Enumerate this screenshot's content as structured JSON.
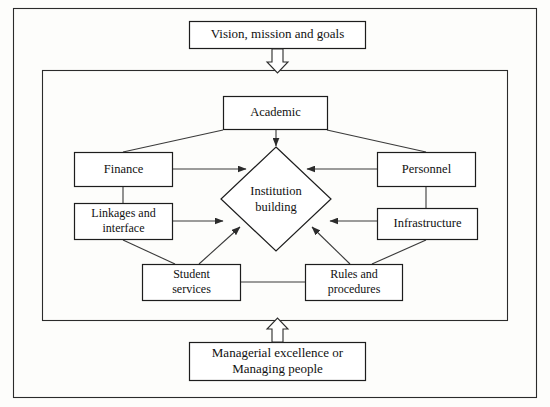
{
  "diagram": {
    "title_top": "Vision, mission and goals",
    "title_bottom_line1": "Managerial excellence or",
    "title_bottom_line2": "Managing people",
    "center": {
      "line1": "Institution",
      "line2": "building"
    },
    "nodes": {
      "academic": "Academic",
      "finance": "Finance",
      "linkages_line1": "Linkages and",
      "linkages_line2": "interface",
      "personnel": "Personnel",
      "infrastructure": "Infrastructure",
      "student_line1": "Student",
      "student_line2": "services",
      "rules_line1": "Rules and",
      "rules_line2": "procedures"
    },
    "colors": {
      "stroke": "#1d1d1d",
      "line": "#3a3a3a",
      "background": "#fdfdfb",
      "box_fill": "#ffffff"
    }
  }
}
